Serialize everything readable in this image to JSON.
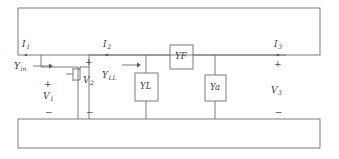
{
  "diagram": {
    "stroke_color": "#6e6e6e",
    "text_color": "#3a3a3a",
    "background": "#ffffff",
    "currents": [
      {
        "name": "current-i1",
        "symbol": "I",
        "subscript": "1",
        "x": 22,
        "y": 42
      },
      {
        "name": "current-i2",
        "symbol": "I",
        "subscript": "2",
        "x": 103,
        "y": 42
      },
      {
        "name": "current-i3",
        "symbol": "I",
        "subscript": "3",
        "x": 274,
        "y": 42
      }
    ],
    "voltages": [
      {
        "name": "voltage-v1",
        "symbol": "V",
        "subscript": "1",
        "x": 43,
        "y": 94
      },
      {
        "name": "voltage-v2",
        "symbol": "V",
        "subscript": "2",
        "x": 83,
        "y": 78
      },
      {
        "name": "voltage-v3",
        "symbol": "V",
        "subscript": "3",
        "x": 272,
        "y": 88
      }
    ],
    "admittance_labels": [
      {
        "name": "admittance-yin",
        "symbol": "Y",
        "subscript": "in",
        "x": 15,
        "y": 64
      },
      {
        "name": "admittance-yll",
        "symbol": "Y",
        "subscript": "LL",
        "x": 103,
        "y": 73
      }
    ],
    "admittance_boxes": [
      {
        "name": "box-yl",
        "symbol": "Y",
        "subscript": "L",
        "x": 135,
        "y": 73,
        "w": 23,
        "h": 28,
        "orientation": "vertical"
      },
      {
        "name": "box-yf",
        "symbol": "Y",
        "subscript": "F",
        "x": 170,
        "y": 45,
        "w": 23,
        "h": 24,
        "orientation": "horizontal"
      },
      {
        "name": "box-ya",
        "symbol": "Y",
        "subscript": "a",
        "x": 205,
        "y": 75,
        "w": 21,
        "h": 26,
        "orientation": "vertical"
      }
    ],
    "polarity_signs": [
      {
        "name": "plus-sign-v1",
        "text": "+",
        "x": 44,
        "y": 82
      },
      {
        "name": "minus-sign-v1",
        "text": "−",
        "x": 45,
        "y": 110
      },
      {
        "name": "plus-sign-v2",
        "text": "+",
        "x": 85,
        "y": 60
      },
      {
        "name": "minus-sign-v2",
        "text": "−",
        "x": 86,
        "y": 110
      },
      {
        "name": "plus-sign-v3",
        "text": "+",
        "x": 274,
        "y": 62
      },
      {
        "name": "minus-sign-v3",
        "text": "−",
        "x": 275,
        "y": 110
      }
    ],
    "arrows": [
      {
        "name": "arrow-yin",
        "x1": 33,
        "y1": 66,
        "x2": 51,
        "y2": 66
      },
      {
        "name": "arrow-yll",
        "x1": 122,
        "y1": 65,
        "x2": 140,
        "y2": 65
      }
    ],
    "rails": [
      {
        "name": "top-rail-block",
        "x": 18,
        "y": 8,
        "w": 302,
        "h": 47
      },
      {
        "name": "bottom-rail-block",
        "x": 18,
        "y": 119,
        "w": 302,
        "h": 29
      }
    ],
    "transistor": {
      "name": "transistor-symbol",
      "x": 72,
      "y": 62,
      "gate_y": 74
    }
  }
}
